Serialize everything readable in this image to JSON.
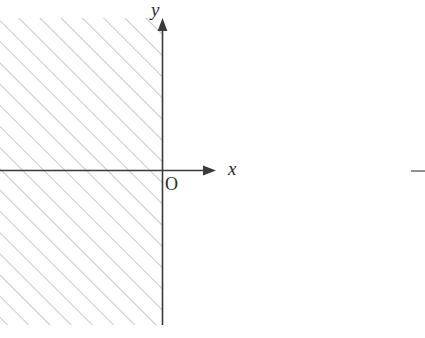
{
  "figure": {
    "canvas": {
      "width": 425,
      "height": 338,
      "background": "#ffffff"
    },
    "colors": {
      "axis": "#3a3a3a",
      "hatch": "#9a9a9a",
      "label": "#2b2b2b",
      "stray_mark": "#8f8f8f"
    },
    "axes": {
      "x_axis": {
        "label": "x",
        "label_style": "italic",
        "y_position": 170,
        "start_x": 0,
        "end_x": 216,
        "arrow": "right"
      },
      "y_axis": {
        "label": "y",
        "label_style": "italic",
        "x_position": 162,
        "start_y": 325,
        "end_y": 18,
        "arrow": "up"
      },
      "origin": {
        "label": "O",
        "label_style": "upright",
        "x": 162,
        "y": 170
      }
    },
    "shaded_region": {
      "name": "hatched-half-plane",
      "hatch_style": "diagonal-45-up-right",
      "hatch_spacing_px": 15,
      "hatch_stroke_width": 1,
      "bounds": {
        "left": 0,
        "top": 18,
        "right": 162,
        "bottom": 325
      }
    },
    "stray_mark": {
      "name": "edge-dash",
      "x": 411,
      "y": 171,
      "width": 14,
      "height": 2
    }
  }
}
